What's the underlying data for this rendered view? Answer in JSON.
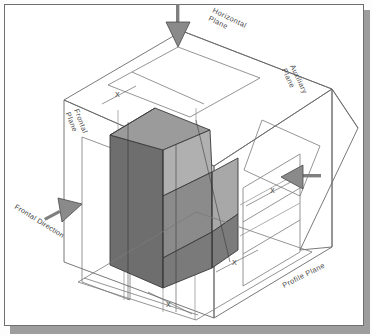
{
  "diagram": {
    "planes": [
      {
        "id": "frontal",
        "label": "Frontal\nPlane"
      },
      {
        "id": "horizontal",
        "label": "Horizontal\nPlane"
      },
      {
        "id": "auxiliary",
        "label": "Auxiliary\nPlane"
      },
      {
        "id": "profile",
        "label": "Profile Plane"
      }
    ],
    "plane_labels": {
      "frontal_line1": "Frontal",
      "frontal_line2": "Plane",
      "horizontal_line1": "Horizontal",
      "horizontal_line2": "Plane",
      "auxiliary_line1": "Auxiliary",
      "auxiliary_line2": "Plane",
      "profile": "Profile Plane"
    },
    "direction_labels": {
      "frontal_direction": "Frontal Direction"
    },
    "dimension_marks": {
      "mark_a": "X",
      "mark_b": "X",
      "mark_c": "X",
      "mark_d": "X"
    },
    "arrows": [
      {
        "id": "top-arrow",
        "name": "horizontal-view-arrow",
        "direction": "down"
      },
      {
        "id": "right-arrow",
        "name": "profile-view-arrow",
        "direction": "left"
      },
      {
        "id": "left-arrow",
        "name": "frontal-view-arrow",
        "direction": "up-right"
      }
    ],
    "colors": {
      "frame_border": "#6f6f6f",
      "shadow": "#9d9d9d",
      "paper": "#ffffff",
      "line": "#5a5a5a",
      "object_dark": "#6f6f6f",
      "object_mid": "#8b8b8b",
      "object_light": "#adadad",
      "object_top": "#9a9a9a",
      "arrow_fill": "#8a8a8a",
      "text": "#4a4a4a"
    }
  }
}
